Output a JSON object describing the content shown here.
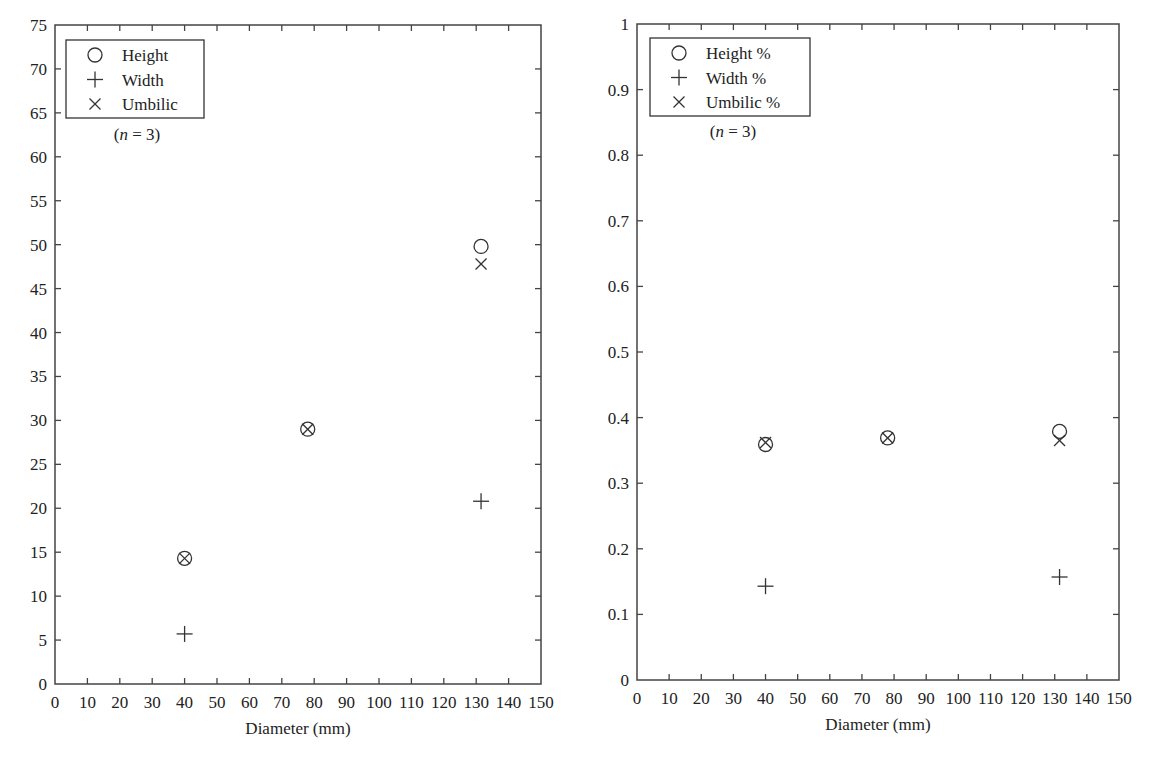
{
  "chart_data": [
    {
      "type": "scatter",
      "title": "",
      "xlabel": "Diameter (mm)",
      "ylabel": "",
      "xlim": [
        0,
        150
      ],
      "ylim": [
        0,
        75
      ],
      "xticks": [
        0,
        10,
        20,
        30,
        40,
        50,
        60,
        70,
        80,
        90,
        100,
        110,
        120,
        130,
        140,
        150
      ],
      "yticks": [
        0,
        5,
        10,
        15,
        20,
        25,
        30,
        35,
        40,
        45,
        50,
        55,
        60,
        65,
        70,
        75
      ],
      "grid": false,
      "legend_position": "upper-left",
      "annotation": "(n = 3)",
      "series": [
        {
          "name": "Height",
          "marker": "circle",
          "x": [
            40,
            78,
            131.5
          ],
          "y": [
            14.3,
            29.0,
            49.8
          ]
        },
        {
          "name": "Width",
          "marker": "plus",
          "x": [
            40,
            131.5
          ],
          "y": [
            5.7,
            20.8
          ]
        },
        {
          "name": "Umbilic",
          "marker": "x",
          "x": [
            40,
            78,
            131.5
          ],
          "y": [
            14.3,
            29.0,
            47.8
          ]
        }
      ]
    },
    {
      "type": "scatter",
      "title": "",
      "xlabel": "Diameter (mm)",
      "ylabel": "",
      "xlim": [
        0,
        150
      ],
      "ylim": [
        0,
        1
      ],
      "xticks": [
        0,
        10,
        20,
        30,
        40,
        50,
        60,
        70,
        80,
        90,
        100,
        110,
        120,
        130,
        140,
        150
      ],
      "yticks": [
        0,
        0.1,
        0.2,
        0.3,
        0.4,
        0.5,
        0.6,
        0.7,
        0.8,
        0.9,
        1
      ],
      "grid": false,
      "legend_position": "upper-left",
      "annotation": "(n = 3)",
      "series": [
        {
          "name": "Height %",
          "marker": "circle",
          "x": [
            40,
            78,
            131.5
          ],
          "y": [
            0.359,
            0.369,
            0.379
          ]
        },
        {
          "name": "Width %",
          "marker": "plus",
          "x": [
            40,
            131.5
          ],
          "y": [
            0.143,
            0.157
          ]
        },
        {
          "name": "Umbilic %",
          "marker": "x",
          "x": [
            40,
            78,
            131.5
          ],
          "y": [
            0.362,
            0.369,
            0.365
          ]
        }
      ]
    }
  ],
  "layout": [
    {
      "frame": {
        "x0": 55,
        "x1": 541,
        "y0": 25,
        "y1": 684
      },
      "legend": {
        "x": 66,
        "y": 40,
        "w": 138,
        "h": 78
      },
      "annotation_pos": {
        "x": 137,
        "y": 140
      }
    },
    {
      "frame": {
        "x0": 637,
        "x1": 1119,
        "y0": 24,
        "y1": 680
      },
      "legend": {
        "x": 650,
        "y": 38,
        "w": 160,
        "h": 78
      },
      "annotation_pos": {
        "x": 733,
        "y": 137
      }
    }
  ]
}
